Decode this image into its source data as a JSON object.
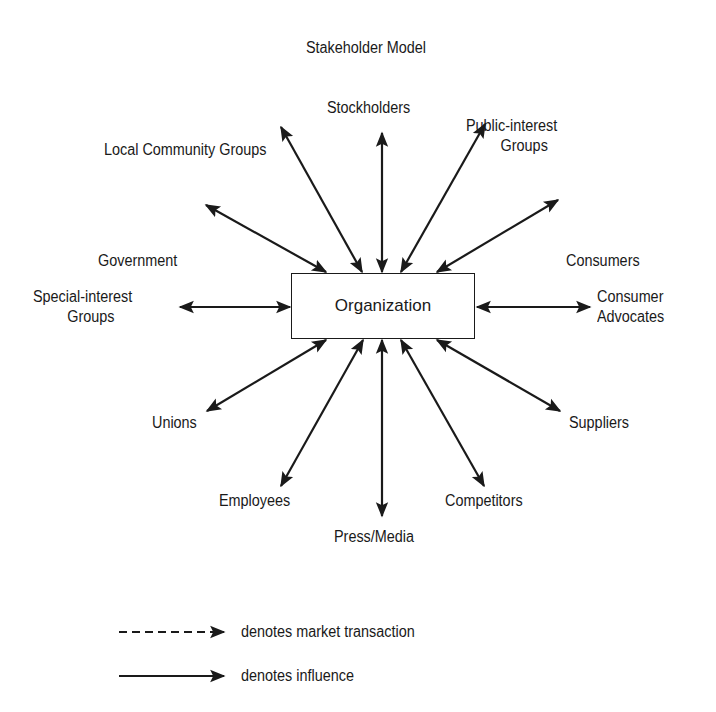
{
  "title": "Stakeholder Model",
  "center": "Organization",
  "stakeholders": {
    "stockholders": "Stockholders",
    "public_interest": [
      "Public-interest",
      "Groups"
    ],
    "local_community": "Local Community Groups",
    "government": "Government",
    "consumers": "Consumers",
    "special_interest": [
      "Special-interest",
      "Groups"
    ],
    "consumer_advocates": [
      "Consumer",
      "Advocates"
    ],
    "unions": "Unions",
    "suppliers": "Suppliers",
    "employees": "Employees",
    "competitors": "Competitors",
    "press_media": "Press/Media"
  },
  "legend": {
    "market_transaction": "denotes market transaction",
    "influence": "denotes influence"
  },
  "colors": {
    "ink": "#1a1a1a",
    "background": "#ffffff"
  }
}
